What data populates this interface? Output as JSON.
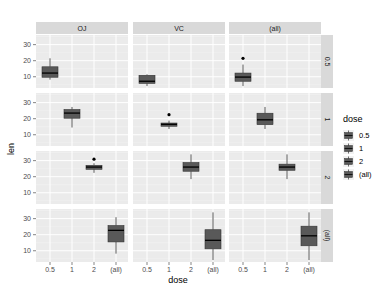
{
  "chart_data": {
    "type": "boxplot",
    "title": "",
    "xlabel": "dose",
    "ylabel": "len",
    "facet_cols": [
      "OJ",
      "VC",
      "(all)"
    ],
    "facet_rows": [
      "0.5",
      "1",
      "2",
      "(all)"
    ],
    "x_categories": [
      "0.5",
      "1",
      "2",
      "(all)"
    ],
    "y_ticks": [
      10,
      20,
      30
    ],
    "ylim": [
      3,
      36
    ],
    "grid": true,
    "legend": {
      "title": "dose",
      "position": "right",
      "entries": [
        "0.5",
        "1",
        "2",
        "(all)"
      ]
    },
    "fill_color": "#595959",
    "panels": [
      {
        "row": "0.5",
        "col": "OJ",
        "x": "0.5",
        "min": 8.2,
        "q1": 9.7,
        "median": 12.3,
        "q3": 16.2,
        "max": 21.5,
        "outliers": []
      },
      {
        "row": "0.5",
        "col": "VC",
        "x": "0.5",
        "min": 4.2,
        "q1": 5.9,
        "median": 7.2,
        "q3": 10.9,
        "max": 11.5,
        "outliers": []
      },
      {
        "row": "0.5",
        "col": "(all)",
        "x": "0.5",
        "min": 4.2,
        "q1": 7.2,
        "median": 9.8,
        "q3": 12.3,
        "max": 17.6,
        "outliers": [
          21.5
        ]
      },
      {
        "row": "1",
        "col": "OJ",
        "x": "1",
        "min": 14.5,
        "q1": 20.3,
        "median": 23.5,
        "q3": 25.7,
        "max": 27.3,
        "outliers": []
      },
      {
        "row": "1",
        "col": "VC",
        "x": "1",
        "min": 13.6,
        "q1": 15.3,
        "median": 16.5,
        "q3": 17.3,
        "max": 18.8,
        "outliers": [
          22.5
        ]
      },
      {
        "row": "1",
        "col": "(all)",
        "x": "1",
        "min": 13.6,
        "q1": 16.3,
        "median": 19.3,
        "q3": 23.4,
        "max": 27.3,
        "outliers": []
      },
      {
        "row": "2",
        "col": "OJ",
        "x": "2",
        "min": 22.4,
        "q1": 24.6,
        "median": 26.0,
        "q3": 27.1,
        "max": 28.4,
        "outliers": [
          30.9
        ]
      },
      {
        "row": "2",
        "col": "VC",
        "x": "2",
        "min": 18.5,
        "q1": 23.4,
        "median": 26.0,
        "q3": 28.8,
        "max": 33.9,
        "outliers": []
      },
      {
        "row": "2",
        "col": "(all)",
        "x": "2",
        "min": 18.5,
        "q1": 24.0,
        "median": 26.0,
        "q3": 27.8,
        "max": 33.9,
        "outliers": []
      },
      {
        "row": "(all)",
        "col": "OJ",
        "x": "(all)",
        "min": 8.2,
        "q1": 15.5,
        "median": 22.7,
        "q3": 25.7,
        "max": 30.9,
        "outliers": []
      },
      {
        "row": "(all)",
        "col": "VC",
        "x": "(all)",
        "min": 4.2,
        "q1": 11.2,
        "median": 16.5,
        "q3": 23.1,
        "max": 33.9,
        "outliers": []
      },
      {
        "row": "(all)",
        "col": "(all)",
        "x": "(all)",
        "min": 4.2,
        "q1": 13.1,
        "median": 19.3,
        "q3": 25.3,
        "max": 33.9,
        "outliers": []
      }
    ]
  },
  "labels": {
    "xlabel": "dose",
    "ylabel": "len",
    "legend_title": "dose",
    "col_strips": [
      "OJ",
      "VC",
      "(all)"
    ],
    "row_strips": [
      "0.5",
      "1",
      "2",
      "(all)"
    ],
    "x_ticks": [
      "0.5",
      "1",
      "2",
      "(all)"
    ],
    "y_ticks": [
      "10",
      "20",
      "30"
    ],
    "legend_entries": [
      "0.5",
      "1",
      "2",
      "(all)"
    ]
  },
  "colors": {
    "panel_bg": "#ebebeb",
    "strip_bg": "#d9d9d9",
    "grid_major": "#ffffff",
    "box_fill": "#595959",
    "box_line": "#333333"
  }
}
